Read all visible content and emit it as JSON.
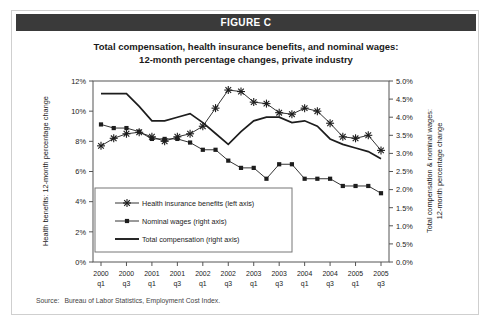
{
  "figure": {
    "header_label": "FIGURE C",
    "title_line_1": "Total compensation, health insurance benefits, and nominal wages:",
    "title_line_2": "12-month percentage changes, private industry",
    "source_label": "Source:",
    "source_text": "Bureau of Labor Statistics, Employment Cost Index."
  },
  "colors": {
    "header_bar": "#3a3a3a",
    "header_text": "#ffffff",
    "series": "#1d1d1d",
    "frame": "#555555",
    "card_border": "#cfcfcf",
    "background": "#ffffff"
  },
  "chart_data": {
    "type": "line",
    "title": "Total compensation, health insurance benefits, and nominal wages: 12-month percentage changes, private industry",
    "xlabel": "",
    "ylabel": "Health benefits: 12-month percentage change",
    "ylabel_right": "Total compensation & nominal wages: 12-month percentage change",
    "grid": false,
    "legend_position": "inside-lower-left",
    "ylim": [
      0,
      12
    ],
    "ylim_right": [
      0,
      5
    ],
    "yticks": [
      "0%",
      "2%",
      "4%",
      "6%",
      "8%",
      "10%",
      "12%"
    ],
    "ytick_values": [
      0,
      2,
      4,
      6,
      8,
      10,
      12
    ],
    "yticks_right": [
      "0.0%",
      "0.5%",
      "1.0%",
      "1.5%",
      "2.0%",
      "2.5%",
      "3.0%",
      "3.5%",
      "4.0%",
      "4.5%",
      "5.0%"
    ],
    "ytick_values_right": [
      0,
      0.5,
      1.0,
      1.5,
      2.0,
      2.5,
      3.0,
      3.5,
      4.0,
      4.5,
      5.0
    ],
    "x": [
      "2000 q1",
      "2000 q2",
      "2000 q3",
      "2000 q4",
      "2001 q1",
      "2001 q2",
      "2001 q3",
      "2001 q4",
      "2002 q1",
      "2002 q2",
      "2002 q3",
      "2002 q4",
      "2003 q1",
      "2003 q2",
      "2003 q3",
      "2003 q4",
      "2004 q1",
      "2004 q2",
      "2004 q3",
      "2004 q4",
      "2005 q1",
      "2005 q2",
      "2005 q3"
    ],
    "xtick_labels": [
      "2000\nq1",
      "2000\nq3",
      "2001\nq1",
      "2001\nq3",
      "2002\nq1",
      "2002\nq3",
      "2003\nq1",
      "2003\nq3",
      "2004\nq1",
      "2004\nq3",
      "2005\nq1",
      "2005\nq3"
    ],
    "xtick_years": [
      "2000",
      "2000",
      "2001",
      "2001",
      "2002",
      "2002",
      "2003",
      "2003",
      "2004",
      "2004",
      "2005",
      "2005"
    ],
    "xtick_quarters": [
      "q1",
      "q3",
      "q1",
      "q3",
      "q1",
      "q3",
      "q1",
      "q3",
      "q1",
      "q3",
      "q1",
      "q3"
    ],
    "series": [
      {
        "name": "Health insurance benefits (left axis)",
        "short_name": "Health insurance benefits",
        "axis": "left",
        "marker": "star",
        "values": [
          7.7,
          8.2,
          8.5,
          8.6,
          8.3,
          8.0,
          8.3,
          8.5,
          9.0,
          10.2,
          11.4,
          11.3,
          10.6,
          10.5,
          9.9,
          9.8,
          10.2,
          10.0,
          9.2,
          8.3,
          8.2,
          8.4,
          7.4
        ]
      },
      {
        "name": "Nominal wages (right axis)",
        "short_name": "Nominal wages",
        "axis": "right",
        "marker": "square",
        "values": [
          3.8,
          3.7,
          3.7,
          3.6,
          3.4,
          3.4,
          3.4,
          3.3,
          3.1,
          3.1,
          2.8,
          2.6,
          2.6,
          2.3,
          2.7,
          2.7,
          2.3,
          2.3,
          2.3,
          2.1,
          2.1,
          2.1,
          1.9
        ]
      },
      {
        "name": "Total compensation (right axis)",
        "short_name": "Total compensation",
        "axis": "right",
        "marker": "none",
        "values": [
          4.65,
          4.65,
          4.65,
          4.3,
          3.9,
          3.9,
          4.0,
          4.1,
          3.85,
          3.55,
          3.25,
          3.6,
          3.9,
          4.0,
          4.0,
          3.85,
          3.9,
          3.75,
          3.4,
          3.25,
          3.15,
          3.05,
          2.85
        ]
      }
    ],
    "legend_entries": [
      {
        "label": "Health insurance benefits (left axis)",
        "marker": "star"
      },
      {
        "label": "Nominal wages (right axis)",
        "marker": "square"
      },
      {
        "label": "Total compensation (right axis)",
        "marker": "line"
      }
    ]
  }
}
